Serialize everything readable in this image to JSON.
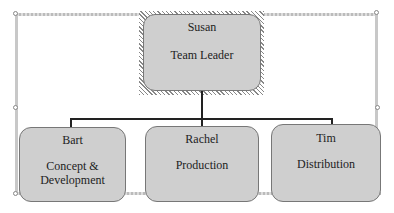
{
  "diagram": {
    "type": "org-chart",
    "root": {
      "name": "Susan",
      "role": "Team Leader"
    },
    "children": [
      {
        "name": "Bart",
        "role": "Concept & Development"
      },
      {
        "name": "Rachel",
        "role": "Production"
      },
      {
        "name": "Tim",
        "role": "Distribution"
      }
    ],
    "colors": {
      "box_fill": "#cfcfcf",
      "box_border": "#777777",
      "connector": "#222222",
      "selection": "#888888"
    }
  },
  "labels": {
    "root_name": "Susan",
    "root_role": "Team Leader",
    "c0_name": "Bart",
    "c0_role_line1": "Concept &",
    "c0_role_line2": "Development",
    "c1_name": "Rachel",
    "c1_role": "Production",
    "c2_name": "Tim",
    "c2_role": "Distribution"
  }
}
